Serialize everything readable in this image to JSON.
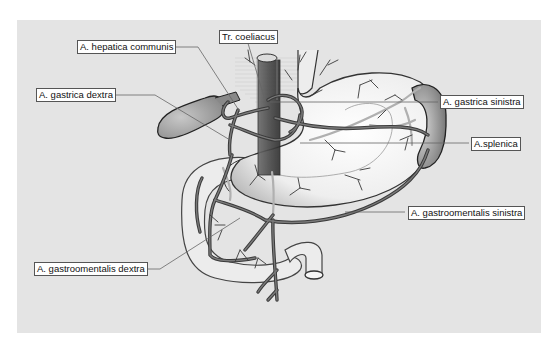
{
  "figure": {
    "background": "#e4e4e4",
    "artery_color": "#555555",
    "organ_fill": "#f2f2f2"
  },
  "labels": {
    "hepatica_communis": "A. hepatica communis",
    "tr_coeliacus": "Tr. coeliacus",
    "gastrica_dextra": "A. gastrica dextra",
    "gastrica_sinistra": "A. gastrica sinistra",
    "splenica": "A.splenica",
    "gastroomentalis_sinistra": "A. gastroomentalis sinistra",
    "gastroomentalis_dextra": "A. gastroomentalis dextra"
  }
}
